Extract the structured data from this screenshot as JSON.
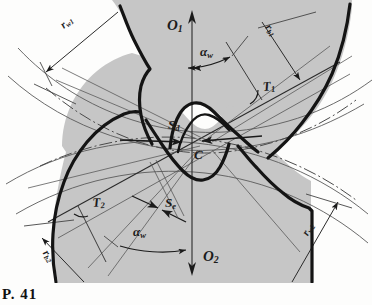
{
  "figure": {
    "domain": "Diagram",
    "caption": "P. 41",
    "background_color": "#fdfdfc",
    "gear_fill_color": "#c6c6c6",
    "outline_color": "#1a1a1a",
    "thin_line_color": "#555555"
  },
  "labels": {
    "r_w1": {
      "text": "r",
      "sub": "w1",
      "name": "label-rw1",
      "desc": "pitch radius of gear 1"
    },
    "r_b1": {
      "text": "r",
      "sub": "b1",
      "name": "label-rb1",
      "desc": "base radius of gear 1"
    },
    "r_w2": {
      "text": "r",
      "sub": "w2",
      "name": "label-rw2",
      "desc": "pitch radius of gear 2"
    },
    "r_b2": {
      "text": "r",
      "sub": "b2",
      "name": "label-rb2",
      "desc": "base radius of gear 2"
    },
    "O_1": {
      "text": "O",
      "sub": "1",
      "name": "label-o1",
      "desc": "centre of gear 1"
    },
    "O_2": {
      "text": "O",
      "sub": "2",
      "name": "label-o2",
      "desc": "centre of gear 2"
    },
    "T_1": {
      "text": "T",
      "sub": "1",
      "name": "label-t1",
      "desc": "tangency point of line of action with base circle 1"
    },
    "T_2": {
      "text": "T",
      "sub": "2",
      "name": "label-t2",
      "desc": "tangency point of line of action with base circle 2"
    },
    "S_d": {
      "text": "S",
      "sub": "d",
      "name": "label-sd",
      "desc": "tooth thickness / space arrow above pitch point"
    },
    "S_e": {
      "text": "S",
      "sub": "e",
      "name": "label-se",
      "desc": "tooth space arrow below pitch point"
    },
    "C": {
      "text": "C",
      "sub": "",
      "name": "label-c",
      "desc": "pitch point"
    },
    "alpha_w_top": {
      "text": "α",
      "sub": "w",
      "name": "label-alpha-w-top",
      "desc": "working pressure angle at gear 1"
    },
    "alpha_w_bottom": {
      "text": "α",
      "sub": "w",
      "name": "label-alpha-w-bottom",
      "desc": "working pressure angle at gear 2"
    }
  },
  "elements": {
    "gear1_body": "upper gear blank, gray shaded, teeth pointing downward",
    "gear2_body": "lower gear blank, gray shaded, teeth pointing upward",
    "centre_line": "vertical centre line O1-O2 through the pitch point C",
    "line_of_action": "inclined line through C tangent to both base circles at T1 and T2",
    "pitch_circle_1": "arc through C belonging to gear 1",
    "pitch_circle_2": "arc through C belonging to gear 2",
    "base_circle_1": "dash-dot arc of gear 1",
    "base_circle_2": "dash-dot arc of gear 2"
  }
}
